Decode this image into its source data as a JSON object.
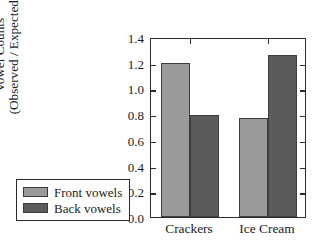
{
  "chart_data": {
    "type": "bar",
    "title": "",
    "xlabel": "",
    "ylabel": "Vowel Counts (Observed / Expected)",
    "ylabel_line1": "Vowel Counts",
    "ylabel_line2": "(Observed / Expected)",
    "categories": [
      "Crackers",
      "Ice Cream"
    ],
    "series": [
      {
        "name": "Front vowels",
        "color": "#9a9a9a",
        "values": [
          1.2,
          0.77
        ]
      },
      {
        "name": "Back vowels",
        "color": "#5b5b5b",
        "values": [
          0.79,
          1.26
        ]
      }
    ],
    "ylim": [
      0.0,
      1.4
    ],
    "yticks": [
      "1.4",
      "1.2",
      "1.0",
      "0.8",
      "0.6",
      "0.4",
      "0.2",
      "0.0"
    ],
    "ytick_values": [
      1.4,
      1.2,
      1.0,
      0.8,
      0.6,
      0.4,
      0.2,
      0.0
    ],
    "grid": false,
    "legend_position": "lower-left-outside",
    "legend_entries": [
      "Front vowels",
      "Back vowels"
    ]
  },
  "legend": {
    "items": [
      {
        "label": "Front vowels",
        "color": "#9a9a9a"
      },
      {
        "label": "Back vowels",
        "color": "#5b5b5b"
      }
    ]
  }
}
